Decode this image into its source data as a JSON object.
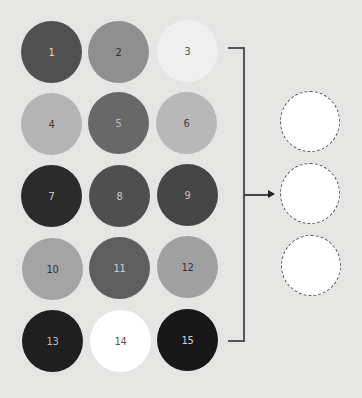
{
  "background": "#e5e5e4",
  "circles": [
    {
      "label": "1",
      "color": "#505050",
      "text_color": "#d8d8d8",
      "row": 0,
      "col": 0
    },
    {
      "label": "2",
      "color": "#8f8f8f",
      "text_color": "#2e2e2e",
      "row": 0,
      "col": 1
    },
    {
      "label": "3",
      "color": "#efefef",
      "text_color": "#555555",
      "row": 0,
      "col": 2
    },
    {
      "label": "4",
      "color": "#b4b4b4",
      "text_color": "#3a3a3a",
      "row": 1,
      "col": 0
    },
    {
      "label": "5",
      "color": "#686868",
      "text_color": "#bdbdbd",
      "row": 1,
      "col": 1
    },
    {
      "label": "6",
      "color": "#b8b8b8",
      "text_color": "#3a3a3a",
      "row": 1,
      "col": 2
    },
    {
      "label": "7",
      "color": "#2b2b2b",
      "text_color": "#c8c8c8",
      "row": 2,
      "col": 0
    },
    {
      "label": "8",
      "color": "#4f4f4f",
      "text_color": "#c8c8c8",
      "row": 2,
      "col": 1
    },
    {
      "label": "9",
      "color": "#454545",
      "text_color": "#c0c0c0",
      "row": 2,
      "col": 2
    },
    {
      "label": "10",
      "color": "#a4a4a4",
      "text_color": "#333333",
      "row": 3,
      "col": 0
    },
    {
      "label": "11",
      "color": "#5e5e5e",
      "text_color": "#cfcfcf",
      "row": 3,
      "col": 1
    },
    {
      "label": "12",
      "color": "#a0a0a0",
      "text_color": "#333333",
      "row": 3,
      "col": 2
    },
    {
      "label": "13",
      "color": "#1f1f1f",
      "text_color": "#bdbdbd",
      "row": 4,
      "col": 0
    },
    {
      "label": "14",
      "color": "#ffffff",
      "text_color": "#555555",
      "row": 4,
      "col": 1
    },
    {
      "label": "15",
      "color": "#181818",
      "text_color": "#d0d0d0",
      "row": 4,
      "col": 2
    }
  ],
  "bracket": {
    "color": "#555555"
  },
  "arrow": {
    "color": "#222222"
  },
  "empty_slots": [
    {
      "label": "",
      "fill": "#ffffff",
      "border": "dashed"
    },
    {
      "label": "",
      "fill": "#ffffff",
      "border": "dashed"
    },
    {
      "label": "",
      "fill": "#ffffff",
      "border": "dashed"
    }
  ]
}
